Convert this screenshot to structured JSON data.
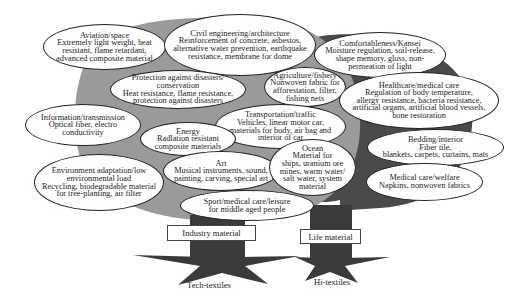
{
  "diagram": {
    "colors": {
      "left_crown": "#9a9a9a",
      "right_crown": "#4a4a4a",
      "trunk": "#3a3a3a",
      "roots": "#3a3a3a"
    },
    "trees": [
      {
        "category_label": "Industry material",
        "root_label": "Tech-textiles"
      },
      {
        "category_label": "Life material",
        "root_label": "Hi-textiles"
      }
    ],
    "applications": [
      {
        "key": "aviation",
        "title": "Aviation/space",
        "lines": [
          "Extremely light weight, heat",
          "resistant, flame retardant,",
          "advanced composite material"
        ]
      },
      {
        "key": "civil",
        "title": "Civil engineering/architecture",
        "lines": [
          "Reinforcement of concrete, asbestos,",
          "alternative water prevention, earthquake",
          "resistance, membrane for dome"
        ]
      },
      {
        "key": "comfort",
        "title": "Comfortableness/Kansei",
        "lines": [
          "Moisture regulation, soil-release,",
          "shape memory, gloss, non-",
          "permeation of light"
        ]
      },
      {
        "key": "protection",
        "title": "Protection against disasters/",
        "lines": [
          "conservation",
          "Heat resistance, flame resistance,",
          "protection against disasters"
        ]
      },
      {
        "key": "agriculture",
        "title": "Agriculture/fishery",
        "lines": [
          "Nonwoven fabric for",
          "afforestation, filter,",
          "fishing nets"
        ]
      },
      {
        "key": "healthcare",
        "title": "Healthcare/medical care",
        "lines": [
          "Regulation of body temperature,",
          "allergy resistance, bacteria resistance,",
          "artificial organs, artificial blood vessels,",
          "bone restoration"
        ]
      },
      {
        "key": "information",
        "title": "Information/transmission",
        "lines": [
          "Optical fiber, electro",
          "conductivity"
        ]
      },
      {
        "key": "transportation",
        "title": "Transportation/traffic",
        "lines": [
          "Vehicles, linear motor car,",
          "materials for body, air bag and",
          "interior of car"
        ]
      },
      {
        "key": "energy",
        "title": "Energy",
        "lines": [
          "Radlation resistant",
          "composite materials"
        ]
      },
      {
        "key": "bedding",
        "title": "Bedding/interior",
        "lines": [
          "Fiber tile,",
          "blankets, carpets, curtains, mats"
        ]
      },
      {
        "key": "environment",
        "title": "Environment adaptation/low",
        "lines": [
          "environmental load",
          "Recycling, biodegradable material",
          "for tree-planting, air filter"
        ]
      },
      {
        "key": "art",
        "title": "Art",
        "lines": [
          "Musical instruments, sound,",
          "painting, carving, special art"
        ]
      },
      {
        "key": "ocean",
        "title": "Ocean",
        "lines": [
          "Material for",
          "ships, uranium ore",
          "mines, warm water/",
          "salt water, system",
          "material"
        ]
      },
      {
        "key": "medical",
        "title": "Medical care/welfare",
        "lines": [
          "Napkins, nonwoven fabrics"
        ]
      },
      {
        "key": "sport",
        "title": "Sport/medical care/leisure",
        "lines": [
          "for middle aged people"
        ]
      }
    ]
  }
}
